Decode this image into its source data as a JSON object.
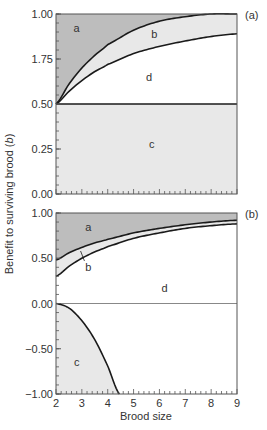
{
  "chart_data": [
    {
      "type": "area",
      "panel_tag": "(a)",
      "xlim": [
        2,
        9
      ],
      "ylim": [
        0,
        1
      ],
      "yticks": [
        {
          "value": 1.0,
          "label": "1.00"
        },
        {
          "value": 0.75,
          "label": "1.75"
        },
        {
          "value": 0.5,
          "label": "0.50"
        },
        {
          "value": 0.25,
          "label": "0.25"
        },
        {
          "value": 0.0,
          "label": "0.00"
        }
      ],
      "y_minor_step": 0.05,
      "x_minor_step": 0.2,
      "series": [
        {
          "name": "upper boundary (a/b)",
          "x": [
            2,
            2.5,
            3,
            3.5,
            4,
            5,
            6,
            7,
            8,
            9
          ],
          "y": [
            0.5,
            0.61,
            0.7,
            0.77,
            0.83,
            0.91,
            0.96,
            0.985,
            1.0,
            1.0
          ]
        },
        {
          "name": "lower boundary (b/d)",
          "x": [
            2,
            2.5,
            3,
            3.5,
            4,
            5,
            6,
            7,
            8,
            9
          ],
          "y": [
            0.5,
            0.57,
            0.63,
            0.68,
            0.72,
            0.78,
            0.82,
            0.85,
            0.875,
            0.89
          ]
        },
        {
          "name": "threshold (d/c)",
          "x": [
            2,
            9
          ],
          "y": [
            0.5,
            0.5
          ]
        }
      ],
      "regions": [
        {
          "label": "a",
          "x": 2.8,
          "y": 0.92
        },
        {
          "label": "b",
          "x": 5.8,
          "y": 0.89
        },
        {
          "label": "d",
          "x": 5.6,
          "y": 0.65
        },
        {
          "label": "c",
          "x": 5.7,
          "y": 0.28
        }
      ]
    },
    {
      "type": "area",
      "panel_tag": "(b)",
      "xlim": [
        2,
        9
      ],
      "ylim": [
        -1,
        1
      ],
      "yticks": [
        {
          "value": 1.0,
          "label": "1.00"
        },
        {
          "value": 0.5,
          "label": "0.50"
        },
        {
          "value": 0.0,
          "label": "0.00"
        },
        {
          "value": -0.5,
          "label": "−0.50"
        },
        {
          "value": -1.0,
          "label": "−1.00"
        }
      ],
      "xticks": [
        {
          "value": 2,
          "label": "2"
        },
        {
          "value": 3,
          "label": "3"
        },
        {
          "value": 4,
          "label": "4"
        },
        {
          "value": 5,
          "label": "5"
        },
        {
          "value": 6,
          "label": "6"
        },
        {
          "value": 7,
          "label": "7"
        },
        {
          "value": 8,
          "label": "8"
        },
        {
          "value": 9,
          "label": "9"
        }
      ],
      "y_minor_step": 0.1,
      "x_minor_step": 0.2,
      "series": [
        {
          "name": "upper boundary (a/b)",
          "x": [
            2,
            2.5,
            3,
            3.5,
            4,
            5,
            6,
            7,
            8,
            9
          ],
          "y": [
            0.48,
            0.56,
            0.62,
            0.67,
            0.71,
            0.78,
            0.83,
            0.87,
            0.9,
            0.92
          ]
        },
        {
          "name": "lower boundary (b/d)",
          "x": [
            2,
            2.5,
            3,
            3.5,
            4,
            5,
            6,
            7,
            8,
            9
          ],
          "y": [
            0.3,
            0.41,
            0.5,
            0.57,
            0.63,
            0.72,
            0.78,
            0.83,
            0.86,
            0.88
          ]
        },
        {
          "name": "zero line",
          "x": [
            2,
            9
          ],
          "y": [
            0,
            0
          ]
        },
        {
          "name": "c boundary",
          "x": [
            2,
            2.5,
            3,
            3.5,
            4,
            4.45
          ],
          "y": [
            0,
            -0.05,
            -0.19,
            -0.4,
            -0.69,
            -1.0
          ]
        }
      ],
      "regions": [
        {
          "label": "a",
          "x": 3.25,
          "y": 0.85
        },
        {
          "label": "b",
          "x": 3.25,
          "y": 0.4
        },
        {
          "label": "d",
          "x": 6.2,
          "y": 0.17
        },
        {
          "label": "c",
          "x": 2.8,
          "y": -0.65
        }
      ]
    }
  ],
  "shared": {
    "xlabel": "Brood size",
    "ylabel_prefix": "Benefit to surviving brood (",
    "ylabel_var": "b",
    "ylabel_suffix": ")"
  },
  "colors": {
    "dark_fill": "#bdbdbd",
    "light_fill": "#e8e8e8",
    "line": "#1a1a1a",
    "zero_line": "#888888",
    "frame": "#555555"
  }
}
